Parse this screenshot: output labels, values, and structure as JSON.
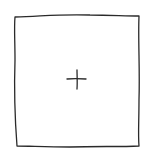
{
  "tile": {
    "icon": "plus-icon",
    "stroke_color": "#2a2a2a",
    "background": "#ffffff",
    "style": "hand-drawn"
  }
}
